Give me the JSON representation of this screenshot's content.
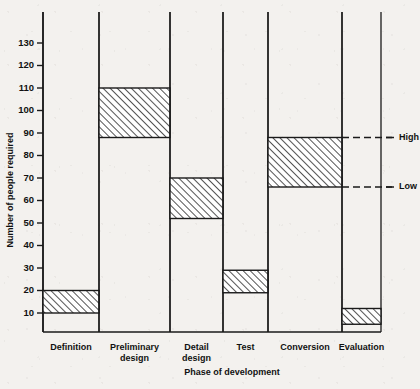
{
  "chart_data": {
    "type": "bar",
    "subtype": "floating-range-bar",
    "title": "",
    "xlabel": "Phase of development",
    "ylabel": "Number of people required",
    "ylim": [
      0,
      138
    ],
    "yticks": [
      10,
      20,
      30,
      40,
      50,
      60,
      70,
      80,
      90,
      100,
      110,
      120,
      130
    ],
    "grid": false,
    "legend": "none",
    "categories": [
      "Definition",
      "Preliminary design",
      "Detail design",
      "Test",
      "Conversion",
      "Evaluation"
    ],
    "category_label_lines": [
      [
        "Definition"
      ],
      [
        "Preliminary",
        "design"
      ],
      [
        "Detail",
        "design"
      ],
      [
        "Test"
      ],
      [
        "Conversion"
      ],
      [
        "Evaluation"
      ]
    ],
    "series": [
      {
        "name": "Low",
        "values": [
          10,
          88,
          52,
          19,
          66,
          5
        ]
      },
      {
        "name": "High",
        "values": [
          20,
          110,
          70,
          29,
          88,
          12
        ]
      }
    ],
    "bars": [
      {
        "category": "Definition",
        "low": 10,
        "high": 20,
        "hatched": true
      },
      {
        "category": "Preliminary design",
        "low": 88,
        "high": 110,
        "hatched": true
      },
      {
        "category": "Detail design",
        "low": 52,
        "high": 70,
        "hatched": true
      },
      {
        "category": "Test",
        "low": 19,
        "high": 29,
        "hatched": true
      },
      {
        "category": "Conversion",
        "low": 66,
        "high": 88,
        "hatched": true
      },
      {
        "category": "Evaluation",
        "low": 5,
        "high": 12,
        "hatched": true
      }
    ],
    "annotations": [
      {
        "label": "High",
        "value": 88,
        "style": "dashed-leader",
        "anchor_category": "Conversion"
      },
      {
        "label": "Low",
        "value": 66,
        "style": "dashed-leader",
        "anchor_category": "Conversion"
      }
    ],
    "colors": {
      "background": "#f3f1ee",
      "axis": "#1a1a1a",
      "bar_outline": "#1a1a1a",
      "bar_fill": "#ffffff",
      "hatch": "#1a1a1a",
      "text": "#111111"
    }
  },
  "axes": {
    "y_title": "Number of people required",
    "x_title": "Phase of development",
    "y_tick_labels": [
      "10",
      "20",
      "30",
      "40",
      "50",
      "60",
      "70",
      "80",
      "90",
      "100",
      "110",
      "120",
      "130"
    ]
  },
  "annotations": {
    "high_label": "High",
    "low_label": "Low"
  }
}
